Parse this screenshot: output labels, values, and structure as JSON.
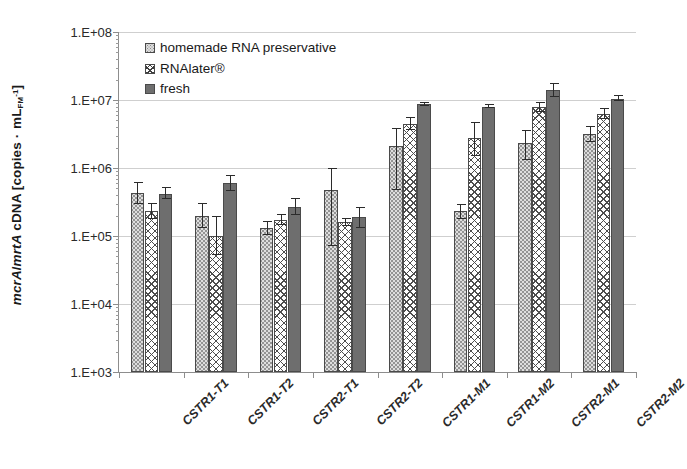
{
  "chart_data": {
    "type": "bar",
    "title": "",
    "xlabel": "",
    "ylabel": "mcrA/mrtA cDNA [copies · mL_FM^-1]",
    "yscale": "log",
    "ylim": [
      1000,
      100000000
    ],
    "ytick_labels": [
      "1.E+08",
      "1.E+07",
      "1.E+06",
      "1.E+05",
      "1.E+04",
      "1.E+03"
    ],
    "ytick_values": [
      100000000,
      10000000,
      1000000,
      100000,
      10000,
      1000
    ],
    "grid": "horizontal",
    "legend_position": "top-left inside plot",
    "categories": [
      "CSTR1-T1",
      "CSTR1-T2",
      "CSTR2-T1",
      "CSTR2-T2",
      "CSTR1-M1",
      "CSTR1-M2",
      "CSTR2-M1",
      "CSTR2-M2"
    ],
    "series": [
      {
        "name": "homemade RNA preservative",
        "fill": "light-gray-stippled",
        "color": "#dedede",
        "values": [
          430000,
          200000,
          130000,
          470000,
          2100000,
          230000,
          2300000,
          3200000
        ],
        "err_low": [
          300000,
          130000,
          105000,
          72000,
          480000,
          175000,
          1300000,
          2400000
        ],
        "err_high": [
          620000,
          310000,
          165000,
          1000000,
          3900000,
          300000,
          3600000,
          4100000
        ]
      },
      {
        "name": "RNAlater®",
        "fill": "white-crosshatch",
        "color": "#ffffff",
        "values": [
          230000,
          100000,
          170000,
          160000,
          4500000,
          2800000,
          8000000,
          6300000
        ],
        "err_low": [
          175000,
          52000,
          145000,
          140000,
          3600000,
          1500000,
          6600000,
          5200000
        ],
        "err_high": [
          310000,
          200000,
          210000,
          185000,
          5600000,
          4800000,
          9500000,
          7600000
        ]
      },
      {
        "name": "fresh",
        "fill": "dark-gray-solid",
        "color": "#6e6e6e",
        "values": [
          420000,
          600000,
          270000,
          190000,
          8700000,
          8000000,
          14000000,
          10500000
        ],
        "err_low": [
          350000,
          460000,
          205000,
          130000,
          8100000,
          7500000,
          11000000,
          9600000
        ],
        "err_high": [
          520000,
          790000,
          360000,
          265000,
          9400000,
          8700000,
          18000000,
          11800000
        ]
      }
    ]
  },
  "legend": {
    "items": [
      {
        "label": "homemade RNA preservative",
        "swatch": "s0"
      },
      {
        "label": "RNAlater®",
        "swatch": "s1"
      },
      {
        "label": "fresh",
        "swatch": "s2"
      }
    ]
  },
  "axis": {
    "y_title_parts": {
      "gene1": "mcrA",
      "slash": "/",
      "gene2": "mrtA",
      "rest": " cDNA [copies ",
      "dot": "·",
      "unit": " mL",
      "sub": "FM",
      "sup": "-1",
      "close": "]"
    }
  }
}
